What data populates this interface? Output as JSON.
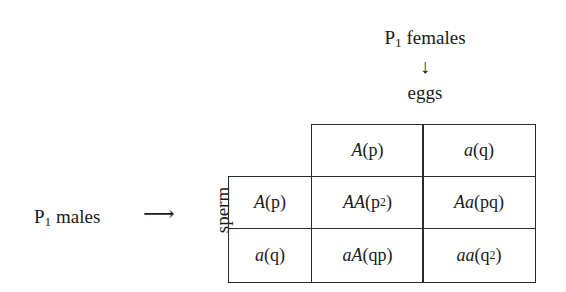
{
  "top": {
    "parent_label": "P",
    "parent_sub": "1",
    "parent_rest": " females",
    "arrow": "↓",
    "gamete_label": "eggs"
  },
  "left": {
    "parent_label": "P",
    "parent_sub": "1",
    "parent_rest": " males",
    "arrow": "⟶",
    "gamete_label": "sperm"
  },
  "columns": [
    {
      "allele": "A",
      "freq": "(p)"
    },
    {
      "allele": "a",
      "freq": "(q)"
    }
  ],
  "rows": [
    {
      "allele": "A",
      "freq": "(p)",
      "cells": [
        {
          "genotype": "AA",
          "freq_base": "(p",
          "freq_sup": "2",
          "freq_close": ")"
        },
        {
          "genotype": "Aa",
          "freq_base": "(pq",
          "freq_sup": "",
          "freq_close": ")"
        }
      ]
    },
    {
      "allele": "a",
      "freq": "(q)",
      "cells": [
        {
          "genotype": "aA",
          "freq_base": "(qp",
          "freq_sup": "",
          "freq_close": ")"
        },
        {
          "genotype": "aa",
          "freq_base": "(q",
          "freq_sup": "2",
          "freq_close": ")"
        }
      ]
    }
  ],
  "colors": {
    "line": "#2a2a2a",
    "text": "#1a1a1a",
    "background": "#ffffff"
  }
}
